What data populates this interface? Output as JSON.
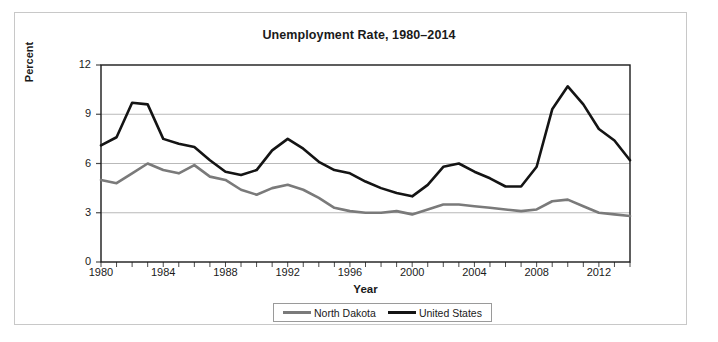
{
  "chart_data": {
    "type": "line",
    "title": "Unemployment Rate, 1980–2014",
    "xlabel": "Year",
    "ylabel": "Percent",
    "ylim": [
      0,
      12
    ],
    "xlim": [
      1980,
      2014
    ],
    "yticks": [
      0,
      3,
      6,
      9,
      12
    ],
    "xticks": [
      1980,
      1984,
      1988,
      1992,
      1996,
      2000,
      2004,
      2008,
      2012
    ],
    "grid": "horizontal",
    "legend_position": "bottom-center",
    "x": [
      1980,
      1981,
      1982,
      1983,
      1984,
      1985,
      1986,
      1987,
      1988,
      1989,
      1990,
      1991,
      1992,
      1993,
      1994,
      1995,
      1996,
      1997,
      1998,
      1999,
      2000,
      2001,
      2002,
      2003,
      2004,
      2005,
      2006,
      2007,
      2008,
      2009,
      2010,
      2011,
      2012,
      2013,
      2014
    ],
    "series": [
      {
        "name": "North Dakota",
        "color": "#7a7a7a",
        "values": [
          5.0,
          4.8,
          5.4,
          6.0,
          5.6,
          5.4,
          5.9,
          5.2,
          5.0,
          4.4,
          4.1,
          4.5,
          4.7,
          4.4,
          3.9,
          3.3,
          3.1,
          3.0,
          3.0,
          3.1,
          2.9,
          3.2,
          3.5,
          3.5,
          3.4,
          3.3,
          3.2,
          3.1,
          3.2,
          3.7,
          3.8,
          3.4,
          3.0,
          2.9,
          2.8
        ]
      },
      {
        "name": "United States",
        "color": "#141414",
        "values": [
          7.1,
          7.6,
          9.7,
          9.6,
          7.5,
          7.2,
          7.0,
          6.2,
          5.5,
          5.3,
          5.6,
          6.8,
          7.5,
          6.9,
          6.1,
          5.6,
          5.4,
          4.9,
          4.5,
          4.2,
          4.0,
          4.7,
          5.8,
          6.0,
          5.5,
          5.1,
          4.6,
          4.6,
          5.8,
          9.3,
          10.7,
          9.6,
          8.1,
          7.4,
          6.2
        ]
      }
    ]
  },
  "legend": {
    "items": [
      {
        "label": "North Dakota",
        "color": "#7a7a7a"
      },
      {
        "label": "United States",
        "color": "#141414"
      }
    ]
  },
  "axes": {
    "y_labels": [
      "12",
      "9",
      "6",
      "3",
      "0"
    ],
    "x_labels": [
      "1980",
      "1984",
      "1988",
      "1992",
      "1996",
      "2000",
      "2004",
      "2008",
      "2012"
    ]
  }
}
